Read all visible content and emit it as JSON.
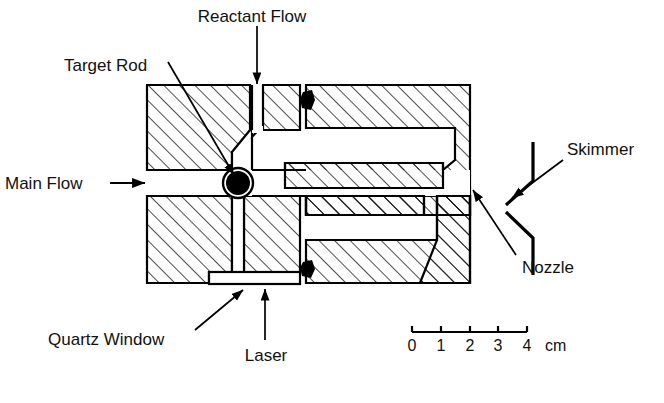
{
  "figure": {
    "kind": "technical-cross-section",
    "background_color": "#ffffff",
    "line_color": "#000000",
    "hatch_color": "#1a1a1a"
  },
  "labels": {
    "target_rod": "Target Rod",
    "reactant_flow": "Reactant Flow",
    "main_flow": "Main Flow",
    "main_flow_arrow": "→",
    "skimmer": "Skimmer",
    "nozzle": "Nozzle",
    "quartz_window": "Quartz Window",
    "laser": "Laser"
  },
  "scale_bar": {
    "ticks": [
      "0",
      "1",
      "2",
      "3",
      "4"
    ],
    "unit": "cm",
    "tick_values": [
      0,
      1,
      2,
      3,
      4
    ],
    "length_cm": 4
  },
  "components": [
    {
      "name": "body-block-upper-left",
      "description": "hatched metal block, upper left of source body"
    },
    {
      "name": "body-block-lower-left",
      "description": "hatched metal block, lower left of source body"
    },
    {
      "name": "body-block-upper-right",
      "description": "hatched metal block forming upper expansion chamber wall"
    },
    {
      "name": "body-block-lower-right",
      "description": "hatched metal block forming lower expansion chamber wall and nozzle taper"
    },
    {
      "name": "target-rod",
      "description": "solid black circular rod cross-section at main flow channel"
    },
    {
      "name": "o-ring-seal-upper",
      "description": "black o-ring seal between upper blocks"
    },
    {
      "name": "o-ring-seal-lower",
      "description": "black o-ring seal between lower blocks"
    },
    {
      "name": "quartz-window",
      "description": "clear rectangular window at base of vertical laser channel"
    },
    {
      "name": "expansion-chamber-cavity",
      "description": "open channel where vaporized material expands"
    },
    {
      "name": "skimmer-cone",
      "description": "cone skimmer downstream of nozzle, drawn in cross-section"
    },
    {
      "name": "nozzle-exit",
      "description": "exit orifice at the right edge of the source body"
    }
  ]
}
